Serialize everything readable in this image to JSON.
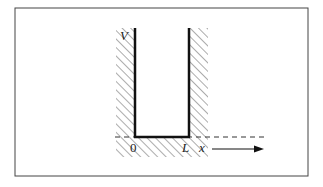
{
  "diagram": {
    "type": "infinite-square-well",
    "labels": {
      "potential": "V",
      "origin": "0",
      "width": "L",
      "axis": "x"
    },
    "colors": {
      "ink": "#111111",
      "hatch": "#555555",
      "frame": "#444444",
      "background": "#ffffff"
    }
  }
}
